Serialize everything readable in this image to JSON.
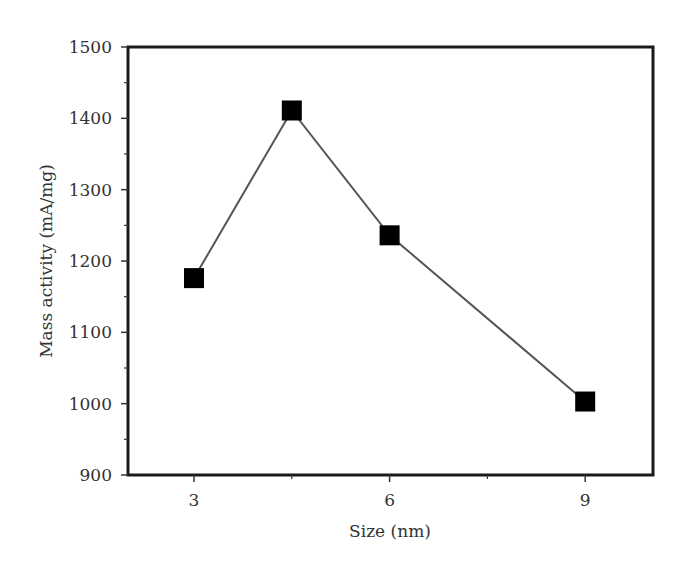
{
  "chart_data": {
    "type": "line",
    "title": "",
    "xlabel": "Size (nm)",
    "ylabel": "Mass activity (mA/mg)",
    "x": [
      3,
      4.5,
      6,
      9
    ],
    "series": [
      {
        "name": "Mass activity",
        "values": [
          1176,
          1411,
          1236,
          1003
        ],
        "marker": "square",
        "color": "#000000",
        "line_color": "#555555"
      }
    ],
    "xlim": [
      2,
      10.1
    ],
    "ylim": [
      900,
      1500
    ],
    "xticks": [
      3,
      6,
      9
    ],
    "xtick_labels": [
      "3",
      "6",
      "9"
    ],
    "yticks": [
      900,
      1000,
      1100,
      1200,
      1300,
      1400,
      1500
    ],
    "ytick_labels": [
      "900",
      "1000",
      "1100",
      "1200",
      "1300",
      "1400",
      "1500"
    ],
    "grid": false,
    "legend": null
  }
}
